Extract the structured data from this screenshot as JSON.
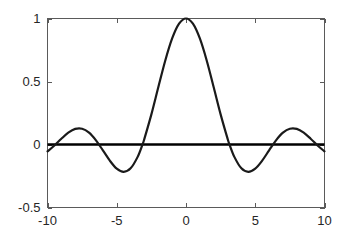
{
  "figure": {
    "background_color": "#ffffff",
    "axes_color": "#5a5a5a",
    "curve_color": "#1a1a1a",
    "zero_line_color": "#000000",
    "label_color": "#262626"
  },
  "chart_data": {
    "type": "line",
    "title": "",
    "xlabel": "",
    "ylabel": "",
    "xlim": [
      -10,
      10
    ],
    "ylim": [
      -0.5,
      1
    ],
    "grid": false,
    "legend": null,
    "xticks": [
      -10,
      -5,
      0,
      5,
      10
    ],
    "xticklabels": [
      "-10",
      "-5",
      "0",
      "5",
      "10"
    ],
    "yticks": [
      -0.5,
      0,
      0.5,
      1
    ],
    "yticklabels": [
      "-0.5",
      "0",
      "0.5",
      "1"
    ],
    "series": [
      {
        "name": "sinc",
        "expression": "sin(x)/x",
        "x": [
          -10,
          -9.5,
          -9,
          -8.5,
          -8,
          -7.5,
          -7,
          -6.5,
          -6,
          -5.5,
          -5,
          -4.5,
          -4,
          -3.5,
          -3.14159,
          -3,
          -2.5,
          -2,
          -1.5,
          -1,
          -0.5,
          0,
          0.5,
          1,
          1.5,
          2,
          2.5,
          3,
          3.14159,
          3.5,
          4,
          4.5,
          5,
          5.5,
          6,
          6.5,
          7,
          7.5,
          8,
          8.5,
          9,
          9.5,
          10
        ],
        "values": [
          -0.0544,
          -0.0079,
          0.0458,
          0.0935,
          0.1237,
          0.1251,
          0.0939,
          0.0331,
          -0.0466,
          -0.128,
          -0.1918,
          -0.2172,
          -0.1892,
          -0.1002,
          0,
          0.047,
          0.2394,
          0.4546,
          0.665,
          0.8415,
          0.9589,
          1.0,
          0.9589,
          0.8415,
          0.665,
          0.4546,
          0.2394,
          0.047,
          0,
          -0.1002,
          -0.1892,
          -0.2172,
          -0.1918,
          -0.128,
          -0.0466,
          0.0331,
          0.0939,
          0.1251,
          0.1237,
          0.0935,
          0.0458,
          -0.0079,
          -0.0544
        ]
      },
      {
        "name": "zero-reference",
        "expression": "y = 0",
        "x": [
          -10,
          10
        ],
        "values": [
          0,
          0
        ]
      }
    ],
    "annotations": []
  }
}
